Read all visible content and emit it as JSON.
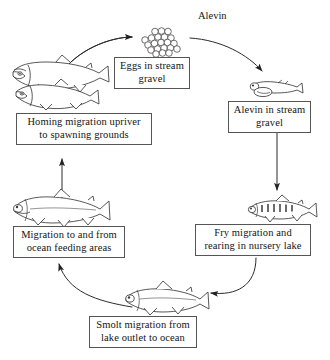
{
  "diagram": {
    "free_labels": {
      "alevin_title": "Alevin"
    },
    "stages": [
      {
        "id": "eggs",
        "line1": "Eggs in stream",
        "line2": "gravel",
        "illustration": "egg-cluster"
      },
      {
        "id": "alevin",
        "line1": "Alevin in stream",
        "line2": "gravel",
        "illustration": "alevin-with-yolk-sac"
      },
      {
        "id": "fry",
        "line1": "Fry migration and",
        "line2": "rearing in nursery lake",
        "illustration": "fry-with-parr-marks"
      },
      {
        "id": "smolt",
        "line1": "Smolt migration from",
        "line2": "lake outlet to ocean",
        "illustration": "smolt-fish"
      },
      {
        "id": "ocean",
        "line1": "Migration to and from",
        "line2": "ocean feeding areas",
        "illustration": "ocean-phase-salmon"
      },
      {
        "id": "homing",
        "line1": "Homing migration upriver",
        "line2": "to spawning grounds",
        "illustration": "two-spawning-adult-salmon"
      }
    ],
    "arrows": [
      {
        "id": "homing-to-eggs",
        "shape": "curve",
        "direction": "right"
      },
      {
        "id": "eggs-to-alevin",
        "shape": "curve",
        "direction": "right-down"
      },
      {
        "id": "alevin-to-fry",
        "shape": "straight",
        "direction": "down"
      },
      {
        "id": "fry-to-smolt",
        "shape": "curve",
        "direction": "down-left"
      },
      {
        "id": "smolt-to-ocean",
        "shape": "curve",
        "direction": "up-left"
      },
      {
        "id": "ocean-to-homing",
        "shape": "straight",
        "direction": "up"
      }
    ],
    "colors": {
      "ink": "#141414",
      "box_border": "#555555",
      "background": "#ffffff",
      "fish_outline": "#3a3a3a"
    }
  }
}
